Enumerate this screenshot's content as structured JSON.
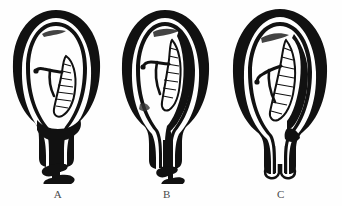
{
  "figure": {
    "background_color": "#fefefe",
    "ink_color": "#111111",
    "label_color": "#4a4a4a",
    "panel_count": 3,
    "width": 342,
    "height": 206
  },
  "panels": [
    {
      "id": "a",
      "label": "A",
      "caption": "Complete (total) placenta previa",
      "placenta_position": "lower uterine segment, completely covering the internal os and extending into the cervical canal",
      "os_status": "covered",
      "cervix_appearance": "filled with solid black placental tissue",
      "fetus_present": true,
      "cord_present": true,
      "placenta_fill": "#111111"
    },
    {
      "id": "b",
      "label": "B",
      "caption": "Partial placenta previa",
      "placenta_position": "right lateral wall descending to the lower segment, partially covering the internal os",
      "os_status": "partially covered",
      "cervix_appearance": "narrow black strip descending through the canal",
      "fetus_present": true,
      "cord_present": true,
      "placenta_fill": "#111111"
    },
    {
      "id": "c",
      "label": "C",
      "caption": "Marginal / low-lying placenta",
      "placenta_position": "right lateral wall, edge reaching near but not over the internal os",
      "os_status": "clear",
      "cervix_appearance": "open, outlined only, no placental tissue",
      "fetus_present": true,
      "cord_present": true,
      "placenta_fill": "#111111"
    }
  ],
  "labels": {
    "a": "A",
    "b": "B",
    "c": "C"
  }
}
